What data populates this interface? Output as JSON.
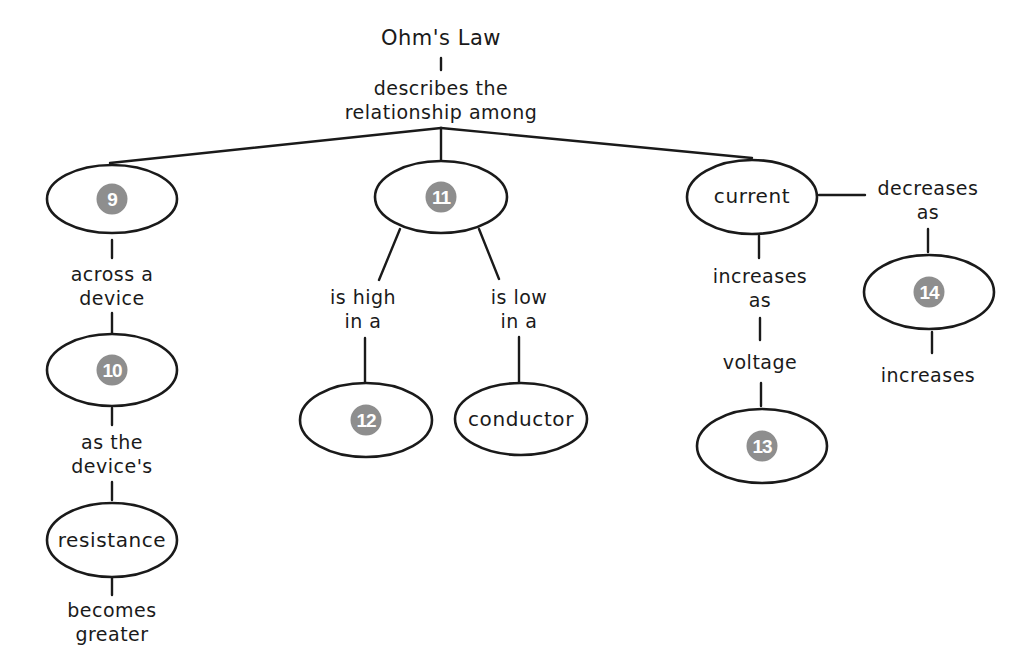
{
  "title": "Ohm's Law",
  "root_link": [
    "describes the",
    "relationship among"
  ],
  "nodes": {
    "n9": {
      "label": "9",
      "kind": "blank"
    },
    "n10": {
      "label": "10",
      "kind": "blank"
    },
    "n11": {
      "label": "11",
      "kind": "blank"
    },
    "n12": {
      "label": "12",
      "kind": "blank"
    },
    "n13": {
      "label": "13",
      "kind": "blank"
    },
    "n14": {
      "label": "14",
      "kind": "blank"
    },
    "resistance": {
      "label": "resistance",
      "kind": "text"
    },
    "conductor": {
      "label": "conductor",
      "kind": "text"
    },
    "current": {
      "label": "current",
      "kind": "text"
    }
  },
  "links": {
    "n9_n10": [
      "across a",
      "device"
    ],
    "n10_resistance": [
      "as the",
      "device's"
    ],
    "resistance_end": [
      "becomes",
      "greater"
    ],
    "n11_n12": [
      "is high",
      "in a"
    ],
    "n11_conductor": [
      "is low",
      "in a"
    ],
    "current_voltage": [
      "increases",
      "as"
    ],
    "voltage": "voltage",
    "current_n14": [
      "decreases",
      "as"
    ],
    "n14_end": "increases"
  },
  "colors": {
    "line": "#1a1a1a",
    "badge_fill": "#8e8e8e",
    "badge_text": "#ffffff",
    "background": "#ffffff"
  }
}
